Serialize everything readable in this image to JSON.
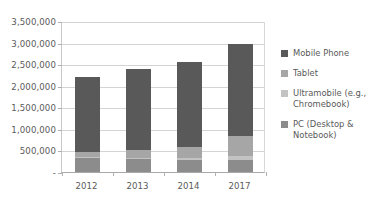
{
  "chart_data": {
    "type": "bar",
    "stacked": true,
    "title": "",
    "xlabel": "",
    "ylabel": "",
    "categories": [
      "2012",
      "2013",
      "2014",
      "2017"
    ],
    "ylim": [
      0,
      3500000
    ],
    "ytick_values": [
      0,
      500000,
      1000000,
      1500000,
      2000000,
      2500000,
      3000000,
      3500000
    ],
    "ytick_labels": [
      "-",
      "500,000",
      "1,000,000",
      "1,500,000",
      "2,000,000",
      "2,500,000",
      "3,000,000",
      "3,500,000"
    ],
    "grid": true,
    "legend_position": "right",
    "series": [
      {
        "name": "PC (Desktop & Notebook)",
        "color": "#8c8c8c",
        "values": [
          340000,
          305000,
          276000,
          271000
        ]
      },
      {
        "name": "Ultramobile (e.g., Chromebook)",
        "color": "#c3c3c3",
        "values": [
          9000,
          18000,
          38000,
          90000
        ]
      },
      {
        "name": "Tablet",
        "color": "#a6a6a6",
        "values": [
          116000,
          197000,
          256000,
          467000
        ]
      },
      {
        "name": "Mobile Phone",
        "color": "#595959",
        "values": [
          1746000,
          1875000,
          1990000,
          2128000
        ]
      }
    ],
    "totals": [
      2211000,
      2395000,
      2560000,
      2956000
    ]
  },
  "legend": {
    "items": [
      {
        "label": "Mobile Phone",
        "color": "#595959",
        "swatch_name": "legend-swatch-mobile-phone"
      },
      {
        "label": "Tablet",
        "color": "#a6a6a6",
        "swatch_name": "legend-swatch-tablet"
      },
      {
        "label": "Ultramobile (e.g.,\nChromebook)",
        "color": "#c3c3c3",
        "swatch_name": "legend-swatch-ultramobile"
      },
      {
        "label": "PC (Desktop &\nNotebook)",
        "color": "#8c8c8c",
        "swatch_name": "legend-swatch-pc"
      }
    ]
  },
  "colors": {
    "mobile_phone": "#595959",
    "tablet": "#a6a6a6",
    "ultramobile": "#c3c3c3",
    "pc": "#8c8c8c",
    "gridline": "#d4d4d4",
    "axis": "#a8a8a8",
    "text": "#595959",
    "background": "#ffffff"
  }
}
